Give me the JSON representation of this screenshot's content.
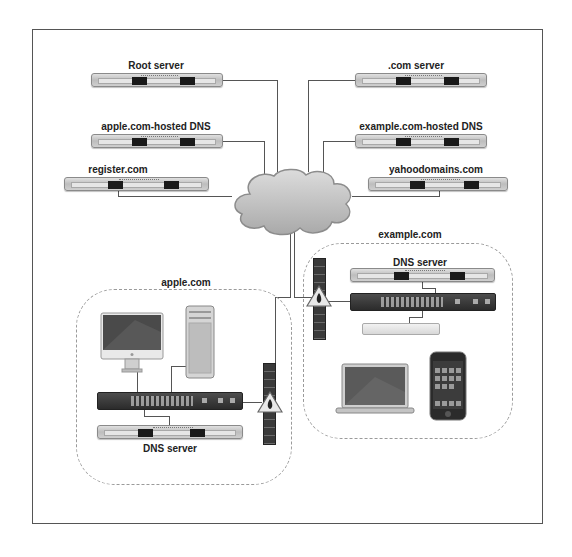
{
  "diagram": {
    "type": "network-topology",
    "internet_cloud": {
      "icon": "cloud-icon"
    },
    "top_left_servers": [
      {
        "label": "Root server",
        "icon": "rack-server-icon"
      },
      {
        "label": "apple.com-hosted DNS",
        "icon": "rack-server-icon"
      },
      {
        "label": "register.com",
        "icon": "rack-server-icon"
      }
    ],
    "top_right_servers": [
      {
        "label": ".com server",
        "icon": "rack-server-icon"
      },
      {
        "label": "example.com-hosted DNS",
        "icon": "rack-server-icon"
      },
      {
        "label": "yahoodomains.com",
        "icon": "rack-server-icon"
      }
    ],
    "zones": {
      "apple": {
        "label": "apple.com",
        "devices": [
          "imac-icon",
          "mac-pro-icon",
          "network-switch-icon",
          "firewall-icon"
        ],
        "dns_label": "DNS server"
      },
      "example": {
        "label": "example.com",
        "devices": [
          "firewall-icon",
          "network-switch-icon",
          "xserve-raid-icon",
          "macbook-icon",
          "iphone-icon"
        ],
        "dns_label": "DNS server"
      }
    }
  }
}
